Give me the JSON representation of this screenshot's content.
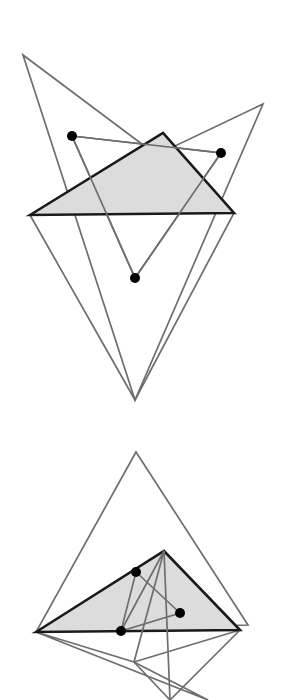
{
  "document": {
    "kind": "geometry-figure",
    "title": "Two triangle configurations with marked interior points",
    "background_color": "#ffffff",
    "width": 285,
    "height": 700
  },
  "style": {
    "outline_stroke_color": "#6e6e6e",
    "outline_stroke_width": 1.7,
    "shaded_fill_color": "#dcdcdc",
    "shaded_stroke_color": "#1a1a1a",
    "shaded_stroke_width": 2.6,
    "dot_fill_color": "#000000",
    "dot_radius": 5.0,
    "connector_stroke_color": "#6e6e6e",
    "connector_stroke_width": 1.7
  },
  "figures": [
    {
      "id": "figure-top",
      "label": "Top figure",
      "shaded_triangle": {
        "name": "top-shaded-triangle",
        "points": "30,215 163,133 234,213",
        "vertices": [
          {
            "label": "A",
            "x": 30,
            "y": 215
          },
          {
            "label": "B",
            "x": 163,
            "y": 133
          },
          {
            "label": "C",
            "x": 234,
            "y": 213
          }
        ]
      },
      "outline_triangles": [
        {
          "name": "top-outline-triangle-1",
          "points": "23,55 234,213 135,400",
          "vertices": [
            {
              "label": "P1",
              "x": 23,
              "y": 55
            },
            {
              "label": "P2",
              "x": 234,
              "y": 213
            },
            {
              "label": "P3",
              "x": 135,
              "y": 400
            }
          ]
        },
        {
          "name": "top-outline-triangle-2",
          "points": "263,104 30,215 135,400",
          "vertices": [
            {
              "label": "Q1",
              "x": 263,
              "y": 104
            },
            {
              "label": "Q2",
              "x": 30,
              "y": 215
            },
            {
              "label": "Q3",
              "x": 135,
              "y": 400
            }
          ]
        }
      ],
      "dot_triangle": {
        "name": "top-dot-triangle",
        "points": "72,136 221,153 135,278"
      },
      "dots": [
        {
          "name": "top-dot-left",
          "x": 72,
          "y": 136
        },
        {
          "name": "top-dot-right",
          "x": 221,
          "y": 153
        },
        {
          "name": "top-dot-bottom",
          "x": 135,
          "y": 278
        }
      ]
    },
    {
      "id": "figure-bottom",
      "label": "Bottom figure",
      "shaded_triangle": {
        "name": "bottom-shaded-triangle",
        "points": "36,632 164,551 240,630",
        "vertices": [
          {
            "label": "A",
            "x": 36,
            "y": 632
          },
          {
            "label": "B",
            "x": 164,
            "y": 551
          },
          {
            "label": "C",
            "x": 240,
            "y": 630
          }
        ]
      },
      "outline_triangles": [
        {
          "name": "bottom-outline-triangle-1",
          "points": "136,452 248,625 36,632",
          "vertices": [
            {
              "label": "P1",
              "x": 136,
              "y": 452
            },
            {
              "label": "P2",
              "x": 248,
              "y": 625
            },
            {
              "label": "P3",
              "x": 36,
              "y": 632
            }
          ]
        },
        {
          "name": "bottom-outline-triangle-2",
          "points": "36,632 208,700 134,662",
          "vertices": [
            {
              "label": "Q1",
              "x": 36,
              "y": 632
            },
            {
              "label": "Q2",
              "x": 208,
              "y": 700
            },
            {
              "label": "Q3",
              "x": 134,
              "y": 662
            }
          ]
        },
        {
          "name": "bottom-outline-triangle-3",
          "points": "134,662 240,630 170,700",
          "vertices": [
            {
              "label": "R1",
              "x": 134,
              "y": 662
            },
            {
              "label": "R2",
              "x": 240,
              "y": 630
            },
            {
              "label": "R3",
              "x": 170,
              "y": 700
            }
          ]
        }
      ],
      "dot_triangle": {
        "name": "bottom-dot-triangle",
        "points": "136,572 180,613 121,631"
      },
      "dots": [
        {
          "name": "bottom-dot-upper",
          "x": 136,
          "y": 572
        },
        {
          "name": "bottom-dot-right",
          "x": 180,
          "y": 613
        },
        {
          "name": "bottom-dot-lower",
          "x": 121,
          "y": 631
        }
      ],
      "extra_segments": [
        {
          "name": "bottom-segment-apex-to-lower-dot",
          "x1": 164,
          "y1": 551,
          "x2": 121,
          "y2": 631
        },
        {
          "name": "bottom-segment-apex-to-v-vertex",
          "x1": 164,
          "y1": 551,
          "x2": 134,
          "y2": 662
        },
        {
          "name": "bottom-segment-apex-down",
          "x1": 164,
          "y1": 551,
          "x2": 170,
          "y2": 700
        }
      ]
    }
  ]
}
